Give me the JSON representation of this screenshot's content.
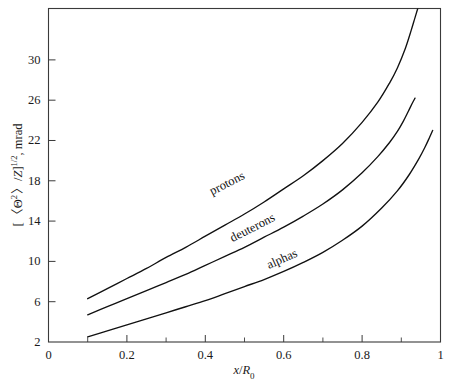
{
  "figure": {
    "title": "",
    "background_color": "#ffffff",
    "line_color": "#111111",
    "axis_color": "#3a3a3a"
  },
  "axes": {
    "x": {
      "label_parts": {
        "variable": "x",
        "slash": "/",
        "denominator": "R",
        "subscript": "0"
      },
      "label_text": "x/R0",
      "min": 0,
      "max": 1,
      "major_ticks": [
        "0",
        "0.2",
        "0.4",
        "0.6",
        "0.8",
        "1"
      ],
      "major_tick_values": [
        0,
        0.2,
        0.4,
        0.6,
        0.8,
        1
      ],
      "minor_tick_values": [
        0.1,
        0.3,
        0.5,
        0.7,
        0.9
      ]
    },
    "y": {
      "label_parts": {
        "open": "[",
        "angle_open": "<",
        "theta": "Θ",
        "sup2": "2",
        "angle_close": ">",
        "slash": "/",
        "z": "Z",
        "close": "]",
        "exponent": "1/2",
        "comma_units": ", mrad"
      },
      "label_text": "[ <Θ2>/Z]1/2, mrad",
      "min": 2,
      "max": 35.1,
      "major_ticks": [
        "2",
        "6",
        "10",
        "14",
        "18",
        "22",
        "26",
        "30"
      ],
      "major_tick_values": [
        2,
        6,
        10,
        14,
        18,
        22,
        26,
        30
      ]
    }
  },
  "chart_data": {
    "type": "line",
    "title": "",
    "xlabel": "x/R0",
    "ylabel": "[ <Θ2>/Z]1/2, mrad",
    "xlim": [
      0,
      1
    ],
    "ylim": [
      2,
      35.1
    ],
    "grid": false,
    "legend": "inline-curve-labels",
    "series": [
      {
        "name": "protons",
        "label": "protons",
        "label_x": 0.46,
        "label_y": 17.4,
        "label_rotation": -27,
        "x": [
          0.1,
          0.15,
          0.2,
          0.25,
          0.3,
          0.35,
          0.4,
          0.45,
          0.5,
          0.55,
          0.6,
          0.65,
          0.7,
          0.75,
          0.8,
          0.84,
          0.87,
          0.89,
          0.91,
          0.925,
          0.935,
          0.942
        ],
        "y": [
          6.3,
          7.3,
          8.3,
          9.3,
          10.4,
          11.4,
          12.5,
          13.6,
          14.7,
          15.9,
          17.2,
          18.5,
          20.0,
          21.7,
          23.8,
          25.8,
          27.7,
          29.2,
          31.1,
          32.9,
          34.2,
          35.1
        ]
      },
      {
        "name": "deuterons",
        "label": "deuterons",
        "label_x": 0.525,
        "label_y": 13.0,
        "label_rotation": -27,
        "x": [
          0.1,
          0.15,
          0.2,
          0.25,
          0.3,
          0.35,
          0.4,
          0.45,
          0.5,
          0.55,
          0.6,
          0.65,
          0.7,
          0.75,
          0.8,
          0.84,
          0.87,
          0.89,
          0.905,
          0.918,
          0.928,
          0.935
        ],
        "y": [
          4.7,
          5.5,
          6.3,
          7.1,
          7.9,
          8.7,
          9.6,
          10.5,
          11.4,
          12.4,
          13.4,
          14.5,
          15.7,
          17.1,
          18.8,
          20.4,
          21.8,
          22.9,
          23.9,
          24.9,
          25.7,
          26.2
        ]
      },
      {
        "name": "alphas",
        "label": "alphas",
        "label_x": 0.6,
        "label_y": 9.9,
        "label_rotation": -24,
        "x": [
          0.1,
          0.15,
          0.2,
          0.25,
          0.3,
          0.35,
          0.4,
          0.45,
          0.5,
          0.55,
          0.6,
          0.65,
          0.7,
          0.75,
          0.8,
          0.85,
          0.89,
          0.92,
          0.945,
          0.96,
          0.972,
          0.98
        ],
        "y": [
          2.5,
          3.1,
          3.7,
          4.3,
          4.9,
          5.5,
          6.1,
          6.8,
          7.5,
          8.2,
          9.0,
          9.9,
          10.9,
          12.1,
          13.5,
          15.3,
          17.0,
          18.6,
          20.2,
          21.3,
          22.3,
          23.0
        ]
      }
    ]
  }
}
